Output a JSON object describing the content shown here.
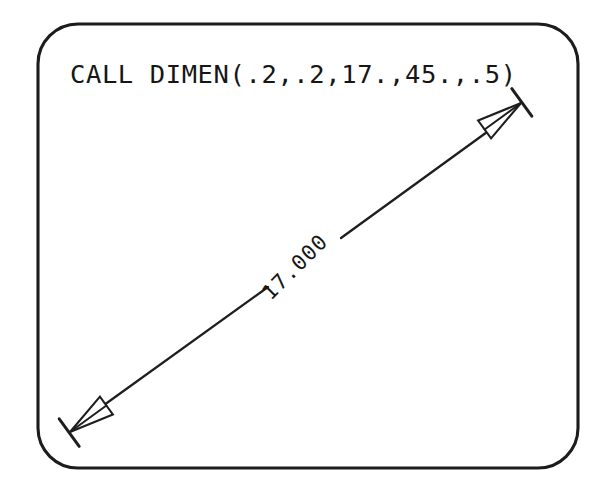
{
  "figure": {
    "kind": "dimension-line-diagram",
    "background_color": "#ffffff",
    "ink_color": "#1c1c1c",
    "frame": {
      "shape": "rounded-rectangle",
      "x": 38,
      "y": 24,
      "width": 540,
      "height": 444,
      "corner_radius": 40,
      "stroke_width": 3
    },
    "caption": {
      "code_call": "CALL DIMEN(.2,.2,17.,45.,.5)",
      "x": 70,
      "y": 83
    },
    "dimension": {
      "value_label": "17.000",
      "angle_degrees": 45,
      "label_height": 0.2,
      "arrow_size": 0.2,
      "length_argument": "17.",
      "offset_argument": ".5",
      "start_point": {
        "x": 70,
        "y": 432
      },
      "end_point": {
        "x": 521,
        "y": 103
      },
      "label_position": {
        "x": 300,
        "y": 272
      },
      "label_rotation_degrees": -45,
      "arrowhead_style": "open-triangle",
      "terminator_style": "perpendicular-witness-tick"
    },
    "arguments": [
      {
        "name": "text-height",
        "value": ".2"
      },
      {
        "name": "arrow-size",
        "value": ".2"
      },
      {
        "name": "length",
        "value": "17."
      },
      {
        "name": "angle",
        "value": "45."
      },
      {
        "name": "offset",
        "value": ".5"
      }
    ]
  }
}
